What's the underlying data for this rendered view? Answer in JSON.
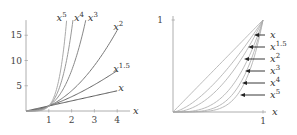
{
  "chart_data": [
    {
      "type": "line",
      "title": "",
      "xlabel": "x",
      "ylabel": "",
      "xlim": [
        0,
        4.3
      ],
      "ylim": [
        0,
        18
      ],
      "xticks": [
        "1",
        "2",
        "3",
        "4"
      ],
      "xtick_values": [
        1,
        2,
        3,
        4
      ],
      "yticks": [
        "5",
        "10",
        "15"
      ],
      "ytick_values": [
        5,
        10,
        15
      ],
      "grid": false,
      "series": [
        {
          "name": "x",
          "base": "x",
          "exp": "",
          "power": 1,
          "color": "#555555",
          "xmax": 4
        },
        {
          "name": "x^1.5",
          "base": "x",
          "exp": "1.5",
          "power": 1.5,
          "color": "#666666",
          "xmax": 4
        },
        {
          "name": "x^2",
          "base": "x",
          "exp": "2",
          "power": 2,
          "color": "#777777",
          "xmax": 4
        },
        {
          "name": "x^3",
          "base": "x",
          "exp": "3",
          "power": 3,
          "color": "#888888",
          "xmax": 2.62
        },
        {
          "name": "x^4",
          "base": "x",
          "exp": "4",
          "power": 4,
          "color": "#999999",
          "xmax": 2.06
        },
        {
          "name": "x^5",
          "base": "x",
          "exp": "5",
          "power": 5,
          "color": "#aaaaaa",
          "xmax": 1.78
        }
      ]
    },
    {
      "type": "line",
      "title": "",
      "xlabel": "x",
      "ylabel": "",
      "xlim": [
        0,
        1
      ],
      "ylim": [
        0,
        1
      ],
      "xticks": [
        "1"
      ],
      "xtick_values": [
        1
      ],
      "yticks": [
        "1"
      ],
      "ytick_values": [
        1
      ],
      "grid": false,
      "legend": "right, arrows pointing to curves",
      "series": [
        {
          "name": "x",
          "base": "x",
          "exp": "",
          "power": 1,
          "color": "#aaaaaa"
        },
        {
          "name": "x^1.5",
          "base": "x",
          "exp": "1.5",
          "power": 1.5,
          "color": "#aaaaaa"
        },
        {
          "name": "x^2",
          "base": "x",
          "exp": "2",
          "power": 2,
          "color": "#aaaaaa"
        },
        {
          "name": "x^3",
          "base": "x",
          "exp": "3",
          "power": 3,
          "color": "#aaaaaa"
        },
        {
          "name": "x^4",
          "base": "x",
          "exp": "4",
          "power": 4,
          "color": "#aaaaaa"
        },
        {
          "name": "x^5",
          "base": "x",
          "exp": "5",
          "power": 5,
          "color": "#aaaaaa"
        }
      ]
    }
  ]
}
